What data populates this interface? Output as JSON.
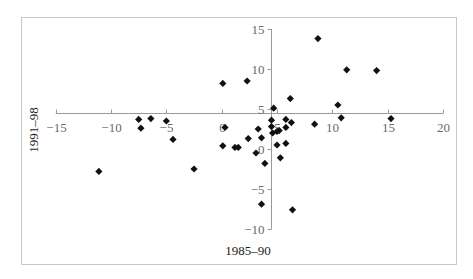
{
  "chart_data": {
    "type": "scatter",
    "title": "",
    "xlabel": "1985–90",
    "ylabel": "1991–98",
    "xlim": [
      -15,
      20
    ],
    "ylim": [
      -10,
      15
    ],
    "x_ticks": [
      -15,
      -10,
      -5,
      0,
      5,
      10,
      15,
      20
    ],
    "y_ticks": [
      15,
      10,
      5,
      0,
      -5,
      -10
    ],
    "x_tick_labels": [
      "−15",
      "−10",
      "−5",
      "0",
      "5",
      "10",
      "15",
      "20"
    ],
    "y_tick_labels": [
      "15",
      "10",
      "5",
      "0",
      "−5",
      "−10"
    ],
    "axes_cross_at": {
      "x": 4.5,
      "y": 4.5
    },
    "grid": false,
    "legend": null,
    "marker": "diamond",
    "marker_color": "#111111",
    "series": [
      {
        "name": "countries",
        "points": [
          [
            -11.1,
            -2.8
          ],
          [
            -7.5,
            3.7
          ],
          [
            -7.3,
            2.6
          ],
          [
            -6.4,
            3.8
          ],
          [
            -5.0,
            3.5
          ],
          [
            -4.4,
            1.2
          ],
          [
            -2.5,
            -2.5
          ],
          [
            0.1,
            8.2
          ],
          [
            0.3,
            2.7
          ],
          [
            0.1,
            0.4
          ],
          [
            1.2,
            0.2
          ],
          [
            1.5,
            0.2
          ],
          [
            2.3,
            8.5
          ],
          [
            2.4,
            1.3
          ],
          [
            3.3,
            2.5
          ],
          [
            3.6,
            1.4
          ],
          [
            3.1,
            -0.5
          ],
          [
            3.9,
            -1.8
          ],
          [
            3.6,
            -6.9
          ],
          [
            4.5,
            3.6
          ],
          [
            4.5,
            2.8
          ],
          [
            4.7,
            5.1
          ],
          [
            4.6,
            2.0
          ],
          [
            5.0,
            2.2
          ],
          [
            5.2,
            2.3
          ],
          [
            5.0,
            0.5
          ],
          [
            5.3,
            -1.1
          ],
          [
            5.8,
            3.7
          ],
          [
            5.8,
            2.7
          ],
          [
            5.8,
            0.7
          ],
          [
            6.2,
            6.3
          ],
          [
            6.3,
            3.3
          ],
          [
            6.4,
            -7.6
          ],
          [
            8.4,
            3.1
          ],
          [
            8.7,
            13.8
          ],
          [
            10.5,
            5.5
          ],
          [
            10.8,
            3.9
          ],
          [
            11.3,
            9.9
          ],
          [
            14.0,
            9.8
          ],
          [
            15.3,
            3.8
          ]
        ]
      }
    ]
  }
}
